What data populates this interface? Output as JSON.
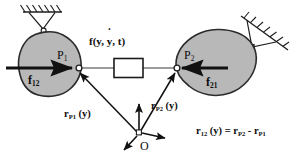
{
  "figure": {
    "type": "mechanics-free-body-diagram",
    "background_color": "#ffffff",
    "body_fill_color": "#b8b8b8",
    "body_stroke_color": "#2b2b2b",
    "line_color": "#111111"
  },
  "labels": {
    "force_element": {
      "text_before": "f(y, ",
      "text_dot": "y",
      "text_after": ", t)",
      "full": "f(y, ẏ, t)"
    },
    "point_1": {
      "base": "P",
      "sub": "1"
    },
    "point_2": {
      "base": "P",
      "sub": "2"
    },
    "force_12": {
      "base": "f",
      "sub": "12"
    },
    "force_21": {
      "base": "f",
      "sub": "21"
    },
    "vector_rp1": {
      "base": "r",
      "sub": "P1",
      "arg": "(y)"
    },
    "vector_rp2": {
      "base": "r",
      "sub": "P2",
      "arg": "(y)"
    },
    "origin": "O",
    "equation": {
      "lhs_base": "r",
      "lhs_sub": "12",
      "lhs_arg": "(y)",
      "eq": "=",
      "t1_base": "r",
      "t1_sub": "P2",
      "minus": "-",
      "t2_base": "r",
      "t2_sub": "P1",
      "full": "r12 (y) = rP2 - rP1"
    }
  },
  "elements": {
    "support_left": "hatched-ceiling-support",
    "support_right": "hatched-inclined-wall-support",
    "joint_left": "pin-joint",
    "joint_right": "pin-joint",
    "connector_box": "force-element-box",
    "frame": "coordinate-frame-origin"
  }
}
